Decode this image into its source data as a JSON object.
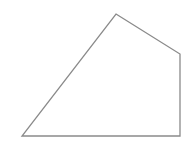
{
  "diagram": {
    "shape": "quadrilateral",
    "stroke_color": "#8a8a8a",
    "fill_color": "none",
    "stroke_width": 1.3,
    "vertices": [
      {
        "x": 116,
        "y": 14
      },
      {
        "x": 180,
        "y": 54
      },
      {
        "x": 180,
        "y": 136
      },
      {
        "x": 22,
        "y": 136
      }
    ]
  }
}
